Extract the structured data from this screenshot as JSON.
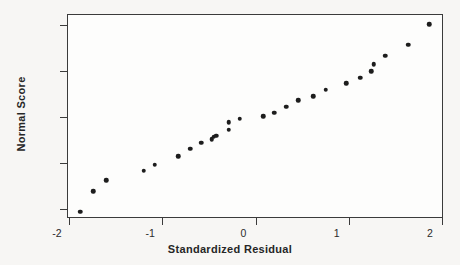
{
  "chart_data": {
    "type": "scatter",
    "title": "",
    "xlabel": "Standardized Residual",
    "ylabel": "Normal Score",
    "xlim": [
      -2.0,
      2.0
    ],
    "ylim": [
      -2.2,
      2.2
    ],
    "xticks": [
      -2,
      -1,
      0,
      1,
      2
    ],
    "xtick_labels": [
      "-2",
      "-1",
      "0",
      "1",
      "2"
    ],
    "yticks": [
      2,
      1,
      0,
      -1,
      -2
    ],
    "ytick_labels": [
      "2",
      "1",
      "0",
      "-1",
      "-2"
    ],
    "grid": false,
    "legend": null,
    "marker": "filled-circle",
    "marker_color": "#1d1d1d",
    "frame_color": "#3b3b3b",
    "background_color": "#f7f6f4",
    "plot_background_color": "#fdfdfc",
    "points": [
      {
        "x": -1.89,
        "y": -2.04
      },
      {
        "x": -1.75,
        "y": -1.59
      },
      {
        "x": -1.61,
        "y": -1.35
      },
      {
        "x": -1.21,
        "y": -1.15
      },
      {
        "x": -1.09,
        "y": -1.02
      },
      {
        "x": -0.84,
        "y": -0.83
      },
      {
        "x": -0.71,
        "y": -0.67
      },
      {
        "x": -0.59,
        "y": -0.54
      },
      {
        "x": -0.48,
        "y": -0.46
      },
      {
        "x": -0.46,
        "y": -0.41
      },
      {
        "x": -0.43,
        "y": -0.39
      },
      {
        "x": -0.3,
        "y": -0.25
      },
      {
        "x": -0.3,
        "y": -0.09
      },
      {
        "x": -0.18,
        "y": -0.02
      },
      {
        "x": 0.07,
        "y": 0.04
      },
      {
        "x": 0.19,
        "y": 0.11
      },
      {
        "x": 0.32,
        "y": 0.25
      },
      {
        "x": 0.45,
        "y": 0.39
      },
      {
        "x": 0.61,
        "y": 0.47
      },
      {
        "x": 0.74,
        "y": 0.61
      },
      {
        "x": 0.96,
        "y": 0.76
      },
      {
        "x": 1.11,
        "y": 0.87
      },
      {
        "x": 1.23,
        "y": 1.02
      },
      {
        "x": 1.26,
        "y": 1.17
      },
      {
        "x": 1.38,
        "y": 1.35
      },
      {
        "x": 1.63,
        "y": 1.59
      },
      {
        "x": 1.85,
        "y": 2.04
      }
    ]
  }
}
